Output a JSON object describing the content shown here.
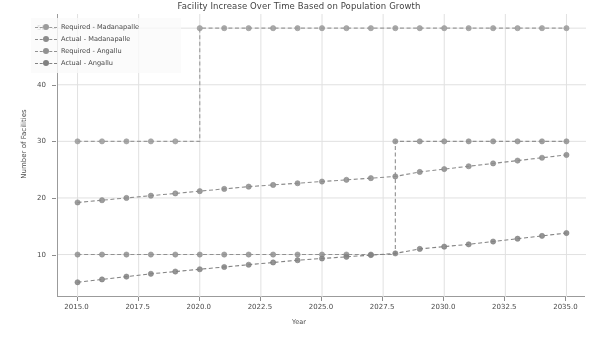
{
  "chart_data": {
    "type": "line",
    "title": "Facility Increase Over Time Based on Population Growth",
    "xlabel": "Year",
    "ylabel": "Number of Facilities",
    "xlim": [
      2014.2,
      2035.8
    ],
    "ylim": [
      2.5,
      52.5
    ],
    "xticks": [
      "2015.0",
      "2017.5",
      "2020.0",
      "2022.5",
      "2025.0",
      "2027.5",
      "2030.0",
      "2032.5",
      "2035.0"
    ],
    "xtick_values": [
      2015.0,
      2017.5,
      2020.0,
      2022.5,
      2025.0,
      2027.5,
      2030.0,
      2032.5,
      2035.0
    ],
    "yticks": [
      "10",
      "20",
      "30",
      "40",
      "50"
    ],
    "ytick_values": [
      10,
      20,
      30,
      40,
      50
    ],
    "grid": true,
    "legend_position": "upper left",
    "x": [
      2015,
      2016,
      2017,
      2018,
      2019,
      2020,
      2021,
      2022,
      2023,
      2024,
      2025,
      2026,
      2027,
      2028,
      2029,
      2030,
      2031,
      2032,
      2033,
      2034,
      2035
    ],
    "series": [
      {
        "name": "Required - Madanapalle",
        "style": "dashed",
        "marker": "circle",
        "color": "#9a9a9a",
        "values": [
          30,
          30,
          30,
          30,
          30,
          50,
          50,
          50,
          50,
          50,
          50,
          50,
          50,
          50,
          50,
          50,
          50,
          50,
          50,
          50,
          50
        ]
      },
      {
        "name": "Actual - Madanapalle",
        "style": "dashed",
        "marker": "circle",
        "color": "#8a8a8a",
        "values": [
          19.2,
          19.6,
          20.0,
          20.4,
          20.8,
          21.2,
          21.6,
          22.0,
          22.3,
          22.6,
          22.9,
          23.2,
          23.5,
          23.8,
          24.6,
          25.1,
          25.6,
          26.1,
          26.6,
          27.1,
          27.6
        ]
      },
      {
        "name": "Required - Angallu",
        "style": "dashed",
        "marker": "circle",
        "color": "#8f8f8f",
        "values": [
          10,
          10,
          10,
          10,
          10,
          10,
          10,
          10,
          10,
          10,
          10,
          10,
          10,
          30,
          30,
          30,
          30,
          30,
          30,
          30,
          30
        ]
      },
      {
        "name": "Actual - Angallu",
        "style": "dashed",
        "marker": "circle",
        "color": "#7f7f7f",
        "values": [
          5.1,
          5.6,
          6.1,
          6.6,
          7.0,
          7.4,
          7.8,
          8.2,
          8.6,
          9.0,
          9.3,
          9.6,
          9.9,
          10.2,
          11.0,
          11.4,
          11.8,
          12.3,
          12.8,
          13.3,
          13.8
        ]
      }
    ]
  },
  "legend": {
    "items": [
      {
        "label": "Required - Madanapalle"
      },
      {
        "label": "Actual - Madanapalle"
      },
      {
        "label": "Required - Angallu"
      },
      {
        "label": "Actual - Angallu"
      }
    ]
  }
}
